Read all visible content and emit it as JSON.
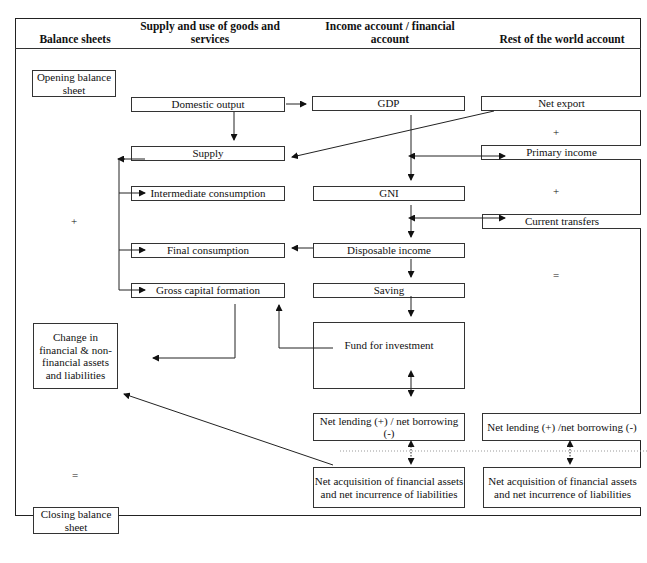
{
  "columns": {
    "balance_sheets": "Balance sheets",
    "supply_use": "Supply and use of goods and services",
    "income_financial": "Income account / financial account",
    "rest_of_world": "Rest of the world account"
  },
  "balance_sheets": {
    "opening": "Opening balance sheet",
    "plus": "+",
    "change": "Change in financial & non-financial assets and liabilities",
    "equals": "=",
    "closing": "Closing balance sheet"
  },
  "supply_use": {
    "domestic_output": "Domestic output",
    "supply": "Supply",
    "intermediate_consumption": "Intermediate consumption",
    "final_consumption": "Final consumption",
    "gross_capital_formation": "Gross capital formation"
  },
  "income_financial": {
    "gdp": "GDP",
    "gni": "GNI",
    "disposable_income": "Disposable income",
    "saving": "Saving",
    "fund_for_investment": "Fund for investment",
    "net_lending": "Net lending (+) / net borrowing (-)",
    "net_acquisition": "Net acquisition of financial assets and net incurrence of liabilities"
  },
  "rest_of_world": {
    "net_export": "Net export",
    "plus1": "+",
    "primary_income": "Primary income",
    "plus2": "+",
    "current_transfers": "Current transfers",
    "equals": "=",
    "net_lending": "Net lending (+) /net borrowing (-)",
    "net_acquisition": "Net acquisition of financial assets and net incurrence of liabilities"
  }
}
